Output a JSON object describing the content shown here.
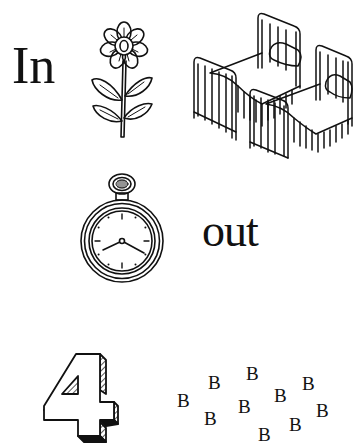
{
  "puzzle": {
    "row1": {
      "word": "In",
      "pictures": [
        "flower",
        "beds (two single beds)"
      ]
    },
    "row2": {
      "pictures": [
        "pocket watch"
      ],
      "word": "out"
    },
    "row3": {
      "number": "4",
      "letters": [
        "B",
        "B",
        "B",
        "B",
        "B",
        "B",
        "B",
        "B",
        "B",
        "B"
      ],
      "letter_count": 10
    }
  },
  "icons": {
    "flower": "flower-icon",
    "beds": "beds-icon",
    "watch": "pocket-watch-icon",
    "four": "number-four-3d-icon"
  },
  "colors": {
    "ink": "#111111",
    "background": "#ffffff"
  }
}
